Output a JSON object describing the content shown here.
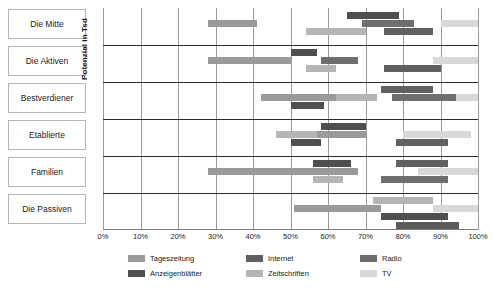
{
  "chart_data": {
    "type": "bar",
    "subtype": "floating-range-bar",
    "title": "",
    "xlabel": "",
    "ylabel": "Potenzial in Tsd",
    "xlim": [
      0,
      100
    ],
    "xunit": "%",
    "grid": true,
    "legend_position": "bottom",
    "categories": [
      "Die Mitte",
      "Die Aktiven",
      "Bestverdiener",
      "Etablierte",
      "Familien",
      "Die Passiven"
    ],
    "tick_labels": [
      "0%",
      "10%",
      "20%",
      "30%",
      "40%",
      "50%",
      "60%",
      "70%",
      "80%",
      "90%",
      "100%"
    ],
    "tick_values": [
      0,
      10,
      20,
      30,
      40,
      50,
      60,
      70,
      80,
      90,
      100
    ],
    "series": [
      {
        "name": "Tageszeitung",
        "color": "#9a9a9a"
      },
      {
        "name": "Zeitschriften",
        "color": "#b5b5b5"
      },
      {
        "name": "Anzeigenblätter",
        "color": "#4f4f4f"
      },
      {
        "name": "Radio",
        "color": "#6e6e6e"
      },
      {
        "name": "Internet",
        "color": "#606060"
      },
      {
        "name": "TV",
        "color": "#d8d8d8"
      }
    ],
    "bars": [
      {
        "category": "Die Mitte",
        "series": "Tageszeitung",
        "start": 28,
        "end": 41,
        "lane": 1,
        "color": "#9a9a9a"
      },
      {
        "category": "Die Mitte",
        "series": "Zeitschriften",
        "start": 54,
        "end": 70,
        "lane": 2,
        "color": "#b5b5b5"
      },
      {
        "category": "Die Mitte",
        "series": "Anzeigenblätter",
        "start": 65,
        "end": 79,
        "lane": 0,
        "color": "#4f4f4f"
      },
      {
        "category": "Die Mitte",
        "series": "Radio",
        "start": 69,
        "end": 83,
        "lane": 1,
        "color": "#6e6e6e"
      },
      {
        "category": "Die Mitte",
        "series": "Internet",
        "start": 75,
        "end": 88,
        "lane": 2,
        "color": "#606060"
      },
      {
        "category": "Die Mitte",
        "series": "TV",
        "start": 90,
        "end": 100,
        "lane": 1,
        "color": "#d8d8d8"
      },
      {
        "category": "Die Aktiven",
        "series": "Tageszeitung",
        "start": 28,
        "end": 50,
        "lane": 1,
        "color": "#9a9a9a"
      },
      {
        "category": "Die Aktiven",
        "series": "Anzeigenblätter",
        "start": 50,
        "end": 57,
        "lane": 0,
        "color": "#4f4f4f"
      },
      {
        "category": "Die Aktiven",
        "series": "Zeitschriften",
        "start": 54,
        "end": 62,
        "lane": 2,
        "color": "#b5b5b5"
      },
      {
        "category": "Die Aktiven",
        "series": "Radio",
        "start": 58,
        "end": 68,
        "lane": 1,
        "color": "#6e6e6e"
      },
      {
        "category": "Die Aktiven",
        "series": "Internet",
        "start": 75,
        "end": 90,
        "lane": 2,
        "color": "#606060"
      },
      {
        "category": "Die Aktiven",
        "series": "TV",
        "start": 88,
        "end": 100,
        "lane": 1,
        "color": "#d8d8d8"
      },
      {
        "category": "Bestverdiener",
        "series": "Tageszeitung",
        "start": 42,
        "end": 66,
        "lane": 1,
        "color": "#9a9a9a"
      },
      {
        "category": "Bestverdiener",
        "series": "Anzeigenblätter",
        "start": 50,
        "end": 59,
        "lane": 2,
        "color": "#4f4f4f"
      },
      {
        "category": "Bestverdiener",
        "series": "Zeitschriften",
        "start": 62,
        "end": 73,
        "lane": 1,
        "color": "#b5b5b5"
      },
      {
        "category": "Bestverdiener",
        "series": "Internet",
        "start": 74,
        "end": 88,
        "lane": 0,
        "color": "#606060"
      },
      {
        "category": "Bestverdiener",
        "series": "Radio",
        "start": 77,
        "end": 94,
        "lane": 1,
        "color": "#6e6e6e"
      },
      {
        "category": "Bestverdiener",
        "series": "TV",
        "start": 94,
        "end": 100,
        "lane": 1,
        "color": "#d8d8d8"
      },
      {
        "category": "Etablierte",
        "series": "Zeitschriften",
        "start": 46,
        "end": 62,
        "lane": 1,
        "color": "#b5b5b5"
      },
      {
        "category": "Etablierte",
        "series": "Anzeigenblätter",
        "start": 50,
        "end": 58,
        "lane": 2,
        "color": "#4f4f4f"
      },
      {
        "category": "Etablierte",
        "series": "Tageszeitung",
        "start": 58,
        "end": 70,
        "lane": 0,
        "color": "#4f4f4f"
      },
      {
        "category": "Etablierte",
        "series": "Radio",
        "start": 57,
        "end": 70,
        "lane": 1,
        "color": "#9a9a9a"
      },
      {
        "category": "Etablierte",
        "series": "TV",
        "start": 80,
        "end": 98,
        "lane": 1,
        "color": "#d8d8d8"
      },
      {
        "category": "Etablierte",
        "series": "Internet",
        "start": 78,
        "end": 92,
        "lane": 2,
        "color": "#606060"
      },
      {
        "category": "Familien",
        "series": "Tageszeitung",
        "start": 28,
        "end": 68,
        "lane": 1,
        "color": "#9a9a9a"
      },
      {
        "category": "Familien",
        "series": "Anzeigenblätter",
        "start": 56,
        "end": 66,
        "lane": 0,
        "color": "#4f4f4f"
      },
      {
        "category": "Familien",
        "series": "Zeitschriften",
        "start": 56,
        "end": 64,
        "lane": 2,
        "color": "#b5b5b5"
      },
      {
        "category": "Familien",
        "series": "Internet",
        "start": 78,
        "end": 92,
        "lane": 0,
        "color": "#606060"
      },
      {
        "category": "Familien",
        "series": "TV",
        "start": 84,
        "end": 100,
        "lane": 1,
        "color": "#d8d8d8"
      },
      {
        "category": "Familien",
        "series": "Radio",
        "start": 74,
        "end": 92,
        "lane": 2,
        "color": "#6e6e6e"
      },
      {
        "category": "Die Passiven",
        "series": "Zeitschriften",
        "start": 72,
        "end": 88,
        "lane": 0,
        "color": "#b5b5b5"
      },
      {
        "category": "Die Passiven",
        "series": "Tageszeitung",
        "start": 51,
        "end": 74,
        "lane": 1,
        "color": "#9a9a9a"
      },
      {
        "category": "Die Passiven",
        "series": "TV",
        "start": 88,
        "end": 100,
        "lane": 1,
        "color": "#d8d8d8"
      },
      {
        "category": "Die Passiven",
        "series": "Internet",
        "start": 74,
        "end": 92,
        "lane": 2,
        "color": "#4f4f4f"
      },
      {
        "category": "Die Passiven",
        "series": "Radio",
        "start": 78,
        "end": 95,
        "lane": 3,
        "color": "#5c5c5c"
      }
    ]
  },
  "legend": {
    "items": [
      {
        "label": "Tageszeitung",
        "color": "#9a9a9a"
      },
      {
        "label": "Anzeigenblätter",
        "color": "#4f4f4f"
      },
      {
        "label": "Internet",
        "color": "#606060"
      },
      {
        "label": "Zeitschriften",
        "color": "#b5b5b5"
      },
      {
        "label": "Radio",
        "color": "#6e6e6e"
      },
      {
        "label": "TV",
        "color": "#d8d8d8"
      }
    ]
  }
}
